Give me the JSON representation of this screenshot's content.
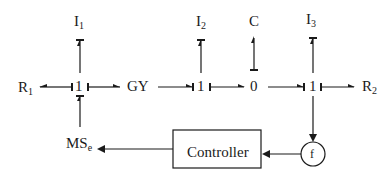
{
  "diagram": {
    "type": "bond-graph",
    "elements": {
      "R1": {
        "base": "R",
        "sub": "1"
      },
      "I1": {
        "base": "I",
        "sub": "1"
      },
      "junction_1a": {
        "label": "1"
      },
      "GY": {
        "label": "GY"
      },
      "I2": {
        "base": "I",
        "sub": "2"
      },
      "junction_1b": {
        "label": "1"
      },
      "C": {
        "label": "C"
      },
      "junction_0": {
        "label": "0"
      },
      "I3": {
        "base": "I",
        "sub": "3"
      },
      "junction_1c": {
        "label": "1"
      },
      "R2": {
        "base": "R",
        "sub": "2"
      },
      "MSe": {
        "base": "MS",
        "sub": "e"
      },
      "controller": {
        "label": "Controller"
      },
      "sensor": {
        "label": "f"
      }
    },
    "bonds": [
      {
        "from": "junction_1a",
        "to": "R1",
        "causal_stroke": "junction_1a"
      },
      {
        "from": "junction_1a",
        "to": "I1",
        "causal_stroke": "I1"
      },
      {
        "from": "GY",
        "to": "junction_1a",
        "causal_stroke": "junction_1a"
      },
      {
        "from": "MSe",
        "to": "junction_1a",
        "causal_stroke": "junction_1a"
      },
      {
        "from": "GY",
        "to": "junction_1b",
        "causal_stroke": "junction_1b"
      },
      {
        "from": "junction_1b",
        "to": "I2",
        "causal_stroke": "I2"
      },
      {
        "from": "junction_1b",
        "to": "junction_0",
        "causal_stroke": "junction_1b"
      },
      {
        "from": "junction_0",
        "to": "C",
        "causal_stroke": "junction_0"
      },
      {
        "from": "junction_0",
        "to": "junction_1c",
        "causal_stroke": "junction_1c"
      },
      {
        "from": "junction_1c",
        "to": "I3",
        "causal_stroke": "I3"
      },
      {
        "from": "junction_1c",
        "to": "R2",
        "causal_stroke": "junction_1c"
      }
    ],
    "signals": [
      {
        "from": "junction_1c",
        "to": "sensor"
      },
      {
        "from": "sensor",
        "to": "controller"
      },
      {
        "from": "controller",
        "to": "MSe"
      }
    ]
  }
}
